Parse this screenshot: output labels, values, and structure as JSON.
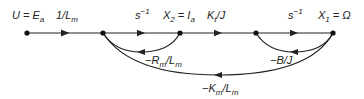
{
  "diagram": {
    "type": "signal-flow-graph",
    "nodes": [
      {
        "id": "U",
        "label": "U = E",
        "sub": "a",
        "x": 27,
        "y": 33
      },
      {
        "id": "n2",
        "label": "",
        "x": 103,
        "y": 33
      },
      {
        "id": "X2",
        "label": "X",
        "sub": "2",
        "suffix": " = I",
        "sub2": "a",
        "x": 180,
        "y": 33
      },
      {
        "id": "n4",
        "label": "",
        "x": 256,
        "y": 33
      },
      {
        "id": "X1",
        "label": "X",
        "sub": "1",
        "suffix": " = Ω",
        "x": 333,
        "y": 33
      }
    ],
    "edges": [
      {
        "from": "U",
        "to": "n2",
        "gain": "1/L",
        "gain_sub": "m"
      },
      {
        "from": "n2",
        "to": "X2",
        "gain": "s",
        "gain_sup": "−1"
      },
      {
        "from": "X2",
        "to": "n4",
        "gain": "K",
        "gain_sub": "t",
        "gain_suffix": "/J"
      },
      {
        "from": "n4",
        "to": "X1",
        "gain": "s",
        "gain_sup": "−1"
      },
      {
        "from": "X2",
        "to": "n2",
        "gain": "−R",
        "gain_sub": "m",
        "gain_mid": "/L",
        "gain_sub2": "m",
        "kind": "feedback"
      },
      {
        "from": "X1",
        "to": "n4",
        "gain": "−B/J",
        "kind": "feedback"
      },
      {
        "from": "X1",
        "to": "n2",
        "gain": "−K",
        "gain_sub": "m",
        "gain_mid": "/L",
        "gain_sub2": "m",
        "kind": "feedback"
      }
    ],
    "colors": {
      "line": "#222222",
      "node": "#111111",
      "background": "#ffffff"
    }
  }
}
